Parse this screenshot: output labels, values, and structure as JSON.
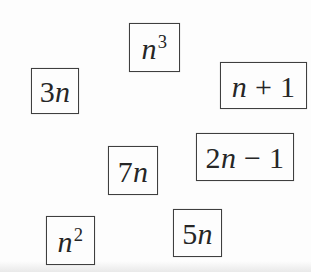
{
  "canvas": {
    "background": "#fdfdfd",
    "border_color": "#3f3f3f",
    "text_color": "#262626"
  },
  "tiles": [
    {
      "id": "n-cubed",
      "label": "n^3",
      "x": 129,
      "y": 23,
      "w": 51,
      "h": 49,
      "expr": [
        {
          "text": "n",
          "italic": true
        },
        {
          "text": "3",
          "sup": true
        }
      ]
    },
    {
      "id": "3n",
      "label": "3n",
      "x": 31,
      "y": 68,
      "w": 48,
      "h": 46,
      "expr": [
        {
          "text": "3"
        },
        {
          "text": "n",
          "italic": true
        }
      ]
    },
    {
      "id": "n-plus-1",
      "label": "n + 1",
      "x": 220,
      "y": 62,
      "w": 87,
      "h": 47,
      "expr": [
        {
          "text": "n",
          "italic": true
        },
        {
          "text": " + "
        },
        {
          "text": "1"
        }
      ]
    },
    {
      "id": "7n",
      "label": "7n",
      "x": 108,
      "y": 146,
      "w": 50,
      "h": 49,
      "expr": [
        {
          "text": "7"
        },
        {
          "text": "n",
          "italic": true
        }
      ]
    },
    {
      "id": "2n-minus-1",
      "label": "2n − 1",
      "x": 196,
      "y": 133,
      "w": 98,
      "h": 48,
      "expr": [
        {
          "text": "2"
        },
        {
          "text": "n",
          "italic": true
        },
        {
          "text": " − "
        },
        {
          "text": "1"
        }
      ]
    },
    {
      "id": "n-squared",
      "label": "n^2",
      "x": 46,
      "y": 216,
      "w": 49,
      "h": 49,
      "expr": [
        {
          "text": "n",
          "italic": true
        },
        {
          "text": "2",
          "sup": true
        }
      ]
    },
    {
      "id": "5n",
      "label": "5n",
      "x": 173,
      "y": 209,
      "w": 49,
      "h": 48,
      "expr": [
        {
          "text": "5"
        },
        {
          "text": "n",
          "italic": true
        }
      ]
    }
  ]
}
